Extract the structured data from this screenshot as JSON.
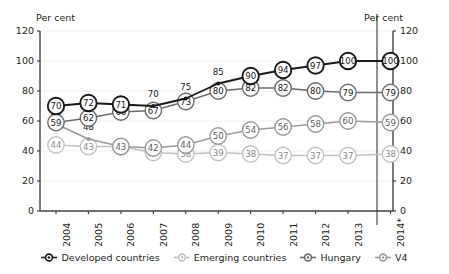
{
  "chart_data": {
    "type": "line",
    "title": "",
    "subtitle": "",
    "xlabel": "",
    "ylabel": "Per cent",
    "ylabel_right": "Per cent",
    "ylim": [
      0,
      120
    ],
    "yticks": [
      0,
      20,
      40,
      60,
      80,
      100,
      120
    ],
    "grid": true,
    "legend_position": "bottom",
    "categories": [
      "2004",
      "2005",
      "2006",
      "2007",
      "2008",
      "2009",
      "2010",
      "2011",
      "2012",
      "2013",
      "2014*"
    ],
    "forecast_separator_after": "2013",
    "series": [
      {
        "name": "Developed countries",
        "color": "#1a1a1a",
        "values": [
          70,
          72,
          71,
          70,
          75,
          85,
          90,
          94,
          97,
          100,
          100
        ],
        "label_above": [
          false,
          false,
          false,
          true,
          true,
          true,
          false,
          false,
          false,
          false,
          false
        ]
      },
      {
        "name": "Hungary",
        "color": "#6d6d6d",
        "values": [
          59,
          62,
          66,
          67,
          73,
          80,
          82,
          82,
          80,
          79,
          79
        ],
        "label_above": [
          false,
          false,
          false,
          false,
          false,
          false,
          false,
          false,
          false,
          false,
          false
        ]
      },
      {
        "name": "V4",
        "color": "#9a9a9a",
        "values": [
          58,
          48,
          43,
          42,
          44,
          50,
          54,
          56,
          58,
          60,
          59
        ],
        "label_above": [
          true,
          true,
          false,
          false,
          false,
          false,
          false,
          false,
          false,
          false,
          false
        ]
      },
      {
        "name": "Emerging countries",
        "color": "#c2c2c2",
        "values": [
          44,
          43,
          43,
          39,
          38,
          39,
          38,
          37,
          37,
          37,
          38
        ],
        "label_above": [
          false,
          false,
          false,
          false,
          false,
          false,
          false,
          false,
          false,
          false,
          false
        ]
      }
    ]
  },
  "axes": {
    "left_unit": "Per cent",
    "right_unit": "Per cent",
    "tick_labels": [
      "120",
      "100",
      "80",
      "60",
      "40",
      "20",
      "0"
    ]
  },
  "legend": {
    "items": [
      {
        "label": "Developed countries",
        "color": "#1a1a1a"
      },
      {
        "label": "Emerging countries",
        "color": "#c2c2c2"
      },
      {
        "label": "Hungary",
        "color": "#6d6d6d"
      },
      {
        "label": "V4",
        "color": "#9a9a9a"
      }
    ]
  }
}
